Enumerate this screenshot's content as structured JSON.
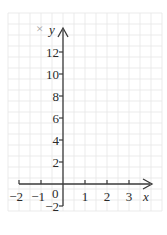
{
  "diagram": {
    "type": "coordinate-axes",
    "close_mark": "×",
    "x_axis": {
      "label": "x",
      "ticks": [
        -2,
        -1,
        1,
        2,
        3
      ],
      "tick_labels": [
        "−2",
        "−1",
        "1",
        "2",
        "3"
      ],
      "range": [
        -2,
        3
      ]
    },
    "y_axis": {
      "label": "y",
      "ticks": [
        -2,
        2,
        4,
        6,
        8,
        10,
        12
      ],
      "tick_labels": [
        "−2",
        "2",
        "4",
        "6",
        "8",
        "10",
        "12"
      ],
      "range": [
        -2,
        12
      ]
    },
    "origin_label": "0",
    "grid": true,
    "colors": {
      "grid": "#e6e6e6",
      "axis": "#3a3a3a",
      "text": "#2a2a2a"
    }
  }
}
